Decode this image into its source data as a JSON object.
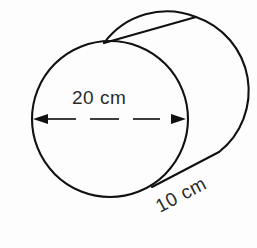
{
  "figure": {
    "shape": "cylinder",
    "background_color": "#fdfdfd",
    "line_color": "#111111",
    "text_color": "#2b2b2b"
  },
  "labels": {
    "diameter": "20 cm",
    "length": "10 cm"
  },
  "geometry": {
    "front_circle": {
      "cx": 110,
      "cy": 119,
      "r": 78
    },
    "back_circle": {
      "cx": 168,
      "cy": 95,
      "r": 78
    },
    "top_tangent": {
      "x1": 104,
      "y1": 43,
      "x2": 196,
      "y2": 17
    },
    "bottom_tangent": {
      "x1": 152,
      "y1": 187,
      "x2": 219,
      "y2": 152
    },
    "dimension_line": {
      "x1": 33,
      "y1": 119,
      "x2": 186,
      "y2": 119
    }
  }
}
